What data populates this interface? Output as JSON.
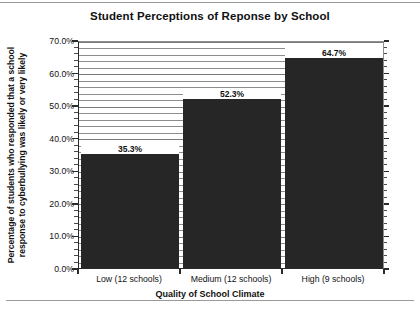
{
  "chart_data": {
    "type": "bar",
    "title": "Student Perceptions of Reponse by School",
    "xlabel": "Quality of School Climate",
    "ylabel_line1": "Percentage of students who responded that a school",
    "ylabel_line2": "response to cyberbullying was likely or very likely",
    "categories": [
      "Low (12 schools)",
      "Medium (12 schools)",
      "High (9 schools)"
    ],
    "values": [
      35.3,
      52.3,
      64.7
    ],
    "value_labels": [
      "35.3%",
      "52.3%",
      "64.7%"
    ],
    "ylim": [
      0,
      70
    ],
    "ytick_values": [
      0,
      10,
      20,
      30,
      40,
      50,
      60,
      70
    ],
    "ytick_labels": [
      "0.0%",
      "10.0%",
      "20.0%",
      "30.0%",
      "40.0%",
      "50.0%",
      "60.0%",
      "70.0%"
    ],
    "minor_tick_step": 2,
    "grid": true,
    "grid_axis": "y",
    "legend": false,
    "bar_color": "#262626",
    "series_name": "Percentage likely or very likely"
  }
}
